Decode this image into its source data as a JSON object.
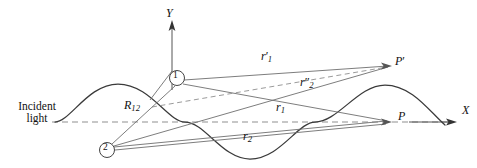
{
  "figure": {
    "colors": {
      "ink": "#1a1a1a",
      "ray": "#6e6e6e",
      "wave": "#3a3a3a",
      "dashed_axis": "#8a8a8a",
      "background": "#ffffff"
    },
    "labels": {
      "incident_light_line1": "Incident",
      "incident_light_line2": "light",
      "y_axis": "Y",
      "x_axis": "X",
      "separation": "R",
      "separation_sub": "12",
      "r1_prime": "r",
      "r1_prime_sub": "1",
      "r1_prime_mark": "′",
      "r2_double_prime": "r",
      "r2_double_prime_sub": "2",
      "r2_double_prime_mark": "″",
      "r1": "r",
      "r1_sub": "1",
      "r2": "r",
      "r2_sub": "2",
      "point_P": "P",
      "point_P_prime": "P",
      "point_P_prime_mark": "′",
      "node1": "1",
      "node2": "2"
    },
    "geometry": {
      "baseline_y": 122,
      "baseline_x_start": 52,
      "baseline_x_end": 452,
      "y_axis_x": 172,
      "y_axis_top": 24,
      "node1": {
        "x": 177,
        "y": 78,
        "r": 7.5
      },
      "node2": {
        "x": 107,
        "y": 150,
        "r": 7.5
      },
      "point_P": {
        "x": 391,
        "y": 122
      },
      "point_P_prime": {
        "x": 392,
        "y": 66
      },
      "wave": {
        "x_start": 55,
        "x_end": 445,
        "amplitude": 38,
        "period": 195,
        "peak1_x": 118,
        "trough_x": 250,
        "peak2_x": 385
      },
      "x_arrow": {
        "x_start": 409,
        "x_end": 456,
        "y": 122
      }
    },
    "rays": [
      {
        "name": "node1-to-P-prime",
        "style": "solid"
      },
      {
        "name": "node1-to-P",
        "style": "solid"
      },
      {
        "name": "node2-to-P-prime",
        "style": "solid"
      },
      {
        "name": "node2-to-P",
        "style": "solid"
      },
      {
        "name": "node2-to-node1",
        "style": "solid"
      },
      {
        "name": "node1-to-P-prime-dashed",
        "style": "dashed"
      },
      {
        "name": "baseline-axis",
        "style": "dashed"
      }
    ]
  }
}
